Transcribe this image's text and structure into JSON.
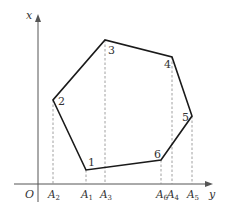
{
  "axes": {
    "vertical_label": "x",
    "horizontal_label": "y",
    "origin_label": "O"
  },
  "polygon": {
    "vertices": [
      {
        "label": "1",
        "x": 86,
        "y": 170
      },
      {
        "label": "2",
        "x": 53,
        "y": 100
      },
      {
        "label": "3",
        "x": 105,
        "y": 40
      },
      {
        "label": "4",
        "x": 172,
        "y": 57
      },
      {
        "label": "5",
        "x": 192,
        "y": 116
      },
      {
        "label": "6",
        "x": 161,
        "y": 160
      }
    ]
  },
  "projections": [
    {
      "label": "A",
      "sub": "2",
      "x": 53
    },
    {
      "label": "A",
      "sub": "1",
      "x": 86
    },
    {
      "label": "A",
      "sub": "3",
      "x": 105
    },
    {
      "label": "A",
      "sub": "6",
      "x": 161
    },
    {
      "label": "A",
      "sub": "4",
      "x": 172
    },
    {
      "label": "A",
      "sub": "5",
      "x": 192
    }
  ],
  "colors": {
    "polygon_stroke": "#1a1a1a",
    "axis_stroke": "#555555",
    "dashed_stroke": "#888888"
  }
}
